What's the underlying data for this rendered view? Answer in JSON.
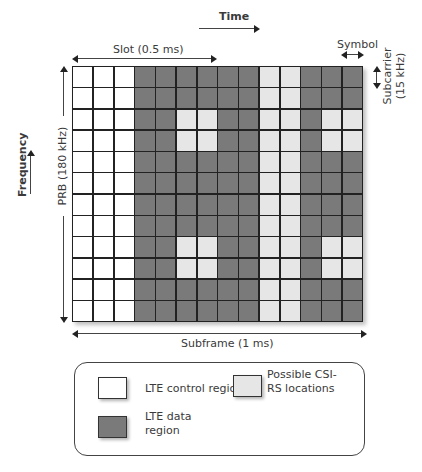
{
  "labels": {
    "time": "Time",
    "slot": "Slot (0.5 ms)",
    "symbol": "Symbol",
    "subcarrier_line1": "Subcarrier",
    "subcarrier_line2": "(15 kHz)",
    "frequency": "Frequency",
    "prb": "PRB (180 kHz)",
    "subframe": "Subframe (1 ms)"
  },
  "legend": {
    "control": "LTE control region",
    "data_line1": "LTE data",
    "data_line2": "region",
    "csi_line1": "Possible CSI-",
    "csi_line2": "RS locations"
  },
  "colors": {
    "control": "#ffffff",
    "data": "#7a7a7a",
    "csi": "#e6e6e6",
    "gridline": "#222222"
  },
  "grid": {
    "columns": 14,
    "rows": 12,
    "column_unit": "OFDM symbol",
    "row_unit": "subcarrier",
    "cells": [
      [
        "control",
        "control",
        "control",
        "data",
        "data",
        "data",
        "data",
        "data",
        "data",
        "csi",
        "csi",
        "data",
        "data",
        "data"
      ],
      [
        "control",
        "control",
        "control",
        "data",
        "data",
        "data",
        "data",
        "data",
        "data",
        "csi",
        "csi",
        "data",
        "data",
        "data"
      ],
      [
        "control",
        "control",
        "control",
        "data",
        "data",
        "csi",
        "csi",
        "data",
        "data",
        "csi",
        "csi",
        "data",
        "csi",
        "csi"
      ],
      [
        "control",
        "control",
        "control",
        "data",
        "data",
        "csi",
        "csi",
        "data",
        "data",
        "csi",
        "csi",
        "data",
        "csi",
        "csi"
      ],
      [
        "control",
        "control",
        "control",
        "data",
        "data",
        "data",
        "data",
        "data",
        "data",
        "csi",
        "csi",
        "data",
        "data",
        "data"
      ],
      [
        "control",
        "control",
        "control",
        "data",
        "data",
        "data",
        "data",
        "data",
        "data",
        "csi",
        "csi",
        "data",
        "data",
        "data"
      ],
      [
        "control",
        "control",
        "control",
        "data",
        "data",
        "data",
        "data",
        "data",
        "data",
        "csi",
        "csi",
        "data",
        "data",
        "data"
      ],
      [
        "control",
        "control",
        "control",
        "data",
        "data",
        "data",
        "data",
        "data",
        "data",
        "csi",
        "csi",
        "data",
        "data",
        "data"
      ],
      [
        "control",
        "control",
        "control",
        "data",
        "data",
        "csi",
        "csi",
        "data",
        "data",
        "csi",
        "csi",
        "data",
        "csi",
        "csi"
      ],
      [
        "control",
        "control",
        "control",
        "data",
        "data",
        "csi",
        "csi",
        "data",
        "data",
        "csi",
        "csi",
        "data",
        "csi",
        "csi"
      ],
      [
        "control",
        "control",
        "control",
        "data",
        "data",
        "data",
        "data",
        "data",
        "data",
        "csi",
        "csi",
        "data",
        "data",
        "data"
      ],
      [
        "control",
        "control",
        "control",
        "data",
        "data",
        "data",
        "data",
        "data",
        "data",
        "csi",
        "csi",
        "data",
        "data",
        "data"
      ]
    ]
  }
}
